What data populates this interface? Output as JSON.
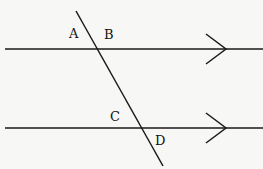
{
  "diagram": {
    "type": "parallel-lines-transversal",
    "colors": {
      "background": "#f7f7f5",
      "stroke": "#1a1a1a"
    },
    "parallel_lines": [
      {
        "id": "top-line",
        "x1": 5,
        "y1": 49,
        "x2": 263,
        "y2": 49,
        "arrow_at": 226
      },
      {
        "id": "bottom-line",
        "x1": 5,
        "y1": 128,
        "x2": 263,
        "y2": 128,
        "arrow_at": 226
      }
    ],
    "transversal": {
      "x1": 76,
      "y1": 11,
      "x2": 163,
      "y2": 166
    },
    "angle_labels": [
      {
        "text": "A",
        "x": 69,
        "y": 38
      },
      {
        "text": "B",
        "x": 104,
        "y": 39
      },
      {
        "text": "C",
        "x": 110,
        "y": 121
      },
      {
        "text": "D",
        "x": 155,
        "y": 145
      }
    ]
  }
}
